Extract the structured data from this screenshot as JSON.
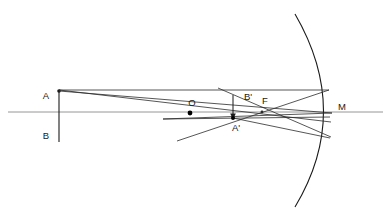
{
  "diagram": {
    "colors": {
      "background": "#ffffff",
      "ray": "#2b2b2b",
      "axis": "#8a8a8a",
      "mirror": "#1a1a1a",
      "object": "#1a1a1a",
      "image": "#1a1a1a",
      "label": "#1a1a1a"
    },
    "labels": {
      "object_top": "A",
      "object_bottom": "B",
      "center_of_curvature": "O",
      "image_top": "B'",
      "image_bottom": "A'",
      "focus": "F",
      "mirror_vertex": "M"
    },
    "points": {
      "A": {
        "x": 59,
        "y": 91
      },
      "B": {
        "x": 59,
        "y": 136
      },
      "O": {
        "x": 190,
        "y": 113
      },
      "F": {
        "x": 262,
        "y": 112
      },
      "M": {
        "x": 333,
        "y": 112
      },
      "A_prime": {
        "x": 233,
        "y": 118
      },
      "B_prime": {
        "x": 233,
        "y": 96
      }
    },
    "axis": {
      "x1": 8,
      "x2": 383,
      "y": 112
    },
    "mirror": {
      "top_x": 295,
      "top_y": 14,
      "bottom_x": 295,
      "bottom_y": 207,
      "vertex_x": 333,
      "vertex_y": 112
    },
    "object_arrow": {
      "x": 59,
      "y_top": 90,
      "y_bottom": 142
    },
    "image_arrow": {
      "x": 233,
      "y_top": 95,
      "y_bottom": 119
    }
  }
}
